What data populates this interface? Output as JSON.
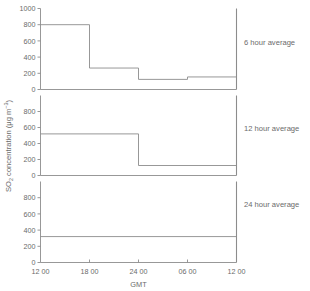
{
  "chart_data": {
    "type": "line",
    "title": "",
    "xlabel": "GMT",
    "ylabel": "SO2 concentration (μg m−3)",
    "ylabel_parts": {
      "prefix": "SO",
      "subscript": "2",
      "middle": " concentration (μg m",
      "superscript": "−3",
      "suffix": ")"
    },
    "x_tick_labels": [
      "12 00",
      "18 00",
      "24 00",
      "06 00",
      "12 00"
    ],
    "x_tick_hours": [
      0,
      6,
      12,
      18,
      24
    ],
    "xlim": [
      0,
      24
    ],
    "grid": false,
    "legend_position": "right-outside",
    "panels": [
      {
        "label": "6 hour average",
        "ylim": [
          0,
          1000
        ],
        "y_tick_labels": [
          "0",
          "200",
          "400",
          "600",
          "800",
          "1000"
        ],
        "y_ticks": [
          0,
          200,
          400,
          600,
          800,
          1000
        ],
        "step_starts": [
          0,
          6,
          12,
          18
        ],
        "step_ends": [
          6,
          12,
          18,
          24
        ],
        "values": [
          800,
          265,
          125,
          155
        ]
      },
      {
        "label": "12 hour average",
        "ylim": [
          0,
          1000
        ],
        "y_tick_labels": [
          "0",
          "200",
          "400",
          "600",
          "800"
        ],
        "y_ticks": [
          0,
          200,
          400,
          600,
          800
        ],
        "step_starts": [
          0,
          12
        ],
        "step_ends": [
          12,
          24
        ],
        "values": [
          520,
          125
        ]
      },
      {
        "label": "24 hour average",
        "ylim": [
          0,
          1000
        ],
        "y_tick_labels": [
          "0",
          "200",
          "400",
          "600",
          "800"
        ],
        "y_ticks": [
          0,
          200,
          400,
          600,
          800
        ],
        "step_starts": [
          0
        ],
        "step_ends": [
          24
        ],
        "values": [
          320
        ]
      }
    ],
    "colors": {
      "line": "#8c8c8c",
      "axis": "#8c8c8c",
      "text": "#6b6b6b",
      "background": "#ffffff"
    }
  }
}
